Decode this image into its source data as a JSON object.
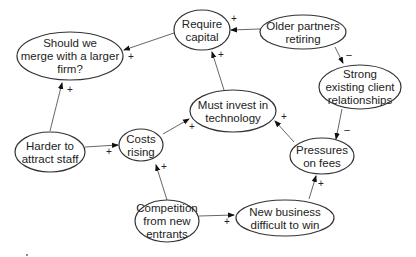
{
  "diagram": {
    "type": "causal-loop-diagram",
    "nodes": [
      {
        "id": "require_capital",
        "lines": [
          "Require",
          "capital"
        ],
        "cx": 202,
        "cy": 30,
        "rx": 28,
        "ry": 20
      },
      {
        "id": "older_partners",
        "lines": [
          "Older partners",
          "retiring"
        ],
        "cx": 303,
        "cy": 32,
        "rx": 43,
        "ry": 17
      },
      {
        "id": "merge",
        "lines": [
          "Should we",
          "merge with a larger",
          "firm?"
        ],
        "cx": 70,
        "cy": 56,
        "rx": 53,
        "ry": 24
      },
      {
        "id": "strong_relationships",
        "lines": [
          "Strong",
          "existing client",
          "relationships"
        ],
        "cx": 360,
        "cy": 87,
        "rx": 41,
        "ry": 22
      },
      {
        "id": "invest_technology",
        "lines": [
          "Must invest in",
          "technology"
        ],
        "cx": 233,
        "cy": 111,
        "rx": 43,
        "ry": 21
      },
      {
        "id": "harder_staff",
        "lines": [
          "Harder to",
          "attract staff"
        ],
        "cx": 50,
        "cy": 152,
        "rx": 35,
        "ry": 20
      },
      {
        "id": "costs_rising",
        "lines": [
          "Costs",
          "rising"
        ],
        "cx": 141,
        "cy": 145,
        "rx": 22,
        "ry": 16
      },
      {
        "id": "pressures_fees",
        "lines": [
          "Pressures",
          "on fees"
        ],
        "cx": 322,
        "cy": 156,
        "rx": 32,
        "ry": 18
      },
      {
        "id": "competition",
        "lines": [
          "Competition",
          "from new",
          "entrants"
        ],
        "cx": 167,
        "cy": 221,
        "rx": 32,
        "ry": 21
      },
      {
        "id": "new_business",
        "lines": [
          "New business",
          "difficult to win"
        ],
        "cx": 285,
        "cy": 218,
        "rx": 49,
        "ry": 18
      }
    ],
    "edges": [
      {
        "from": "require_capital",
        "to": "merge",
        "sign": "+",
        "x1": 174,
        "y1": 33,
        "x2": 124,
        "y2": 50,
        "sx": 131,
        "sy": 60
      },
      {
        "from": "older_partners",
        "to": "require_capital",
        "sign": "+",
        "x1": 260,
        "y1": 29,
        "x2": 231,
        "y2": 30,
        "sx": 234,
        "sy": 22
      },
      {
        "from": "older_partners",
        "to": "strong_relationships",
        "sign": "–",
        "x1": 335,
        "y1": 47,
        "x2": 343,
        "y2": 63,
        "sx": 349,
        "sy": 58
      },
      {
        "from": "invest_technology",
        "to": "require_capital",
        "sign": "+",
        "x1": 224,
        "y1": 90,
        "x2": 212,
        "y2": 52,
        "sx": 221,
        "sy": 58
      },
      {
        "from": "harder_staff",
        "to": "merge",
        "sign": "+",
        "x1": 50,
        "y1": 131,
        "x2": 62,
        "y2": 83,
        "sx": 70,
        "sy": 93
      },
      {
        "from": "harder_staff",
        "to": "costs_rising",
        "sign": "+",
        "x1": 85,
        "y1": 147,
        "x2": 118,
        "y2": 145,
        "sx": 109,
        "sy": 155
      },
      {
        "from": "costs_rising",
        "to": "invest_technology",
        "sign": "+",
        "x1": 163,
        "y1": 134,
        "x2": 189,
        "y2": 119,
        "sx": 192,
        "sy": 130
      },
      {
        "from": "competition",
        "to": "costs_rising",
        "sign": "+",
        "x1": 167,
        "y1": 200,
        "x2": 156,
        "y2": 165,
        "sx": 164,
        "sy": 170
      },
      {
        "from": "competition",
        "to": "new_business",
        "sign": "+",
        "x1": 199,
        "y1": 216,
        "x2": 234,
        "y2": 215,
        "sx": 227,
        "sy": 225
      },
      {
        "from": "new_business",
        "to": "pressures_fees",
        "sign": "+",
        "x1": 309,
        "y1": 199,
        "x2": 316,
        "y2": 176,
        "sx": 321,
        "sy": 187
      },
      {
        "from": "pressures_fees",
        "to": "invest_technology",
        "sign": "+",
        "x1": 294,
        "y1": 142,
        "x2": 275,
        "y2": 121,
        "sx": 284,
        "sy": 120
      },
      {
        "from": "strong_relationships",
        "to": "pressures_fees",
        "sign": "–",
        "x1": 342,
        "y1": 109,
        "x2": 336,
        "y2": 139,
        "sx": 347,
        "sy": 133
      }
    ]
  }
}
